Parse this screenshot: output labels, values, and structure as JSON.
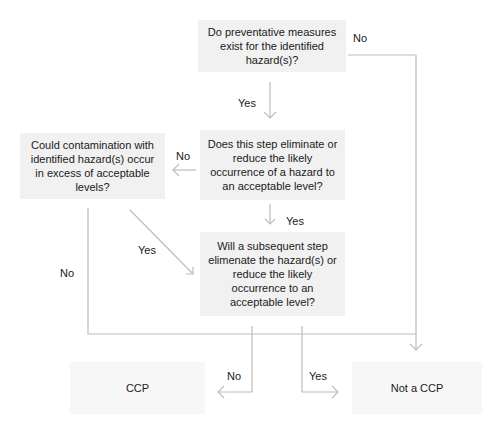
{
  "diagram": {
    "type": "flowchart",
    "title": "",
    "nodes": {
      "q1": "Do preventative measures exist for the identified hazard(s)?",
      "q2": "Does this step eliminate or reduce the likely occurrence of a hazard to an acceptable level?",
      "q3": "Could contamination with identified hazard(s) occur in excess of acceptable levels?",
      "q4": "Will a subsequent step elimenate the hazard(s) or reduce the likely occurrence to an acceptable level?",
      "ccp": "CCP",
      "not_ccp": "Not a CCP"
    },
    "edge_labels": {
      "q1_no": "No",
      "q1_yes": "Yes",
      "q2_no": "No",
      "q2_yes": "Yes",
      "q3_yes": "Yes",
      "q3_no": "No",
      "q4_no": "No",
      "q4_yes": "Yes"
    },
    "edges": [
      {
        "from": "q1",
        "to": "q2",
        "label": "Yes"
      },
      {
        "from": "q1",
        "to": "not_ccp",
        "label": "No"
      },
      {
        "from": "q2",
        "to": "q3",
        "label": "No"
      },
      {
        "from": "q2",
        "to": "q4",
        "label": "Yes"
      },
      {
        "from": "q3",
        "to": "q4",
        "label": "Yes"
      },
      {
        "from": "q3",
        "to": "not_ccp",
        "label": "No"
      },
      {
        "from": "q4",
        "to": "ccp",
        "label": "No"
      },
      {
        "from": "q4",
        "to": "not_ccp",
        "label": "Yes"
      }
    ],
    "colors": {
      "box_fill": "#f1f1f1",
      "line": "#b8b8b8",
      "text": "#1a1a1a"
    }
  }
}
